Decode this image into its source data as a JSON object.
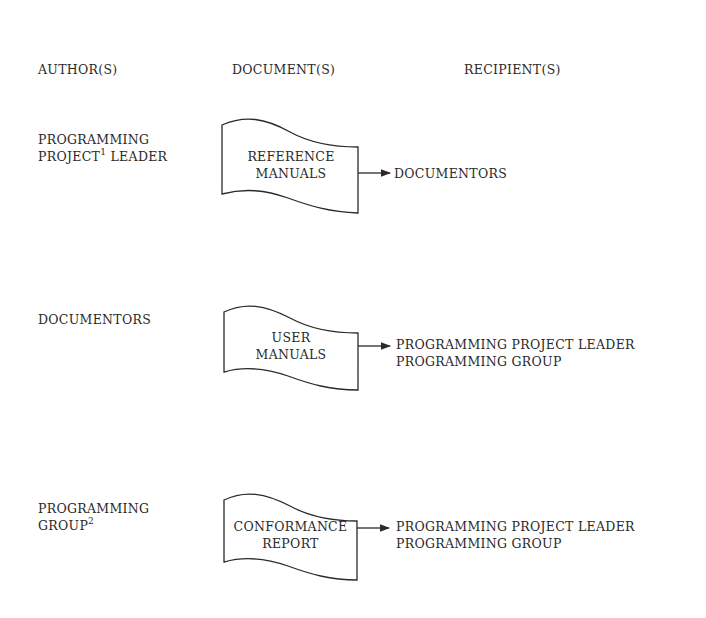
{
  "headers": {
    "authors": "AUTHOR(S)",
    "documents": "DOCUMENT(S)",
    "recipients": "RECIPIENT(S)"
  },
  "rows": [
    {
      "author_line1": "PROGRAMMING",
      "author_line2_pre": "PROJECT",
      "author_sup": "1",
      "author_line2_post": " LEADER",
      "document_line1": "REFERENCE",
      "document_line2": "MANUALS",
      "recipients": [
        "DOCUMENTORS"
      ]
    },
    {
      "author_line1": "DOCUMENTORS",
      "document_line1": "USER",
      "document_line2": "MANUALS",
      "recipients": [
        "PROGRAMMING PROJECT LEADER",
        "PROGRAMMING GROUP"
      ]
    },
    {
      "author_line1": "PROGRAMMING",
      "author_line2_pre": "GROUP",
      "author_sup": "2",
      "document_line1": "CONFORMANCE",
      "document_line2": "REPORT",
      "recipients": [
        "PROGRAMMING PROJECT LEADER",
        "PROGRAMMING GROUP"
      ]
    }
  ],
  "icons": {
    "document_shape": "document-flowchart-symbol",
    "arrow": "right-arrow"
  }
}
